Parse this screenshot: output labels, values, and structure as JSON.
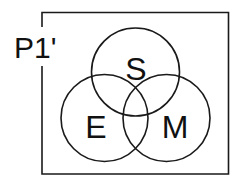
{
  "diagram": {
    "type": "venn",
    "universe_label": "P1'",
    "sets": [
      {
        "label": "S",
        "cx": 135.5,
        "cy": 72,
        "r": 44
      },
      {
        "label": "E",
        "cx": 104.5,
        "cy": 118,
        "r": 43.5
      },
      {
        "label": "M",
        "cx": 166.5,
        "cy": 118,
        "r": 43.5
      }
    ],
    "colors": {
      "stroke": "#1a1a1a",
      "background": "#ffffff"
    }
  }
}
